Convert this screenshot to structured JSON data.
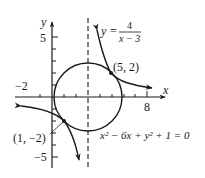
{
  "axes": {
    "x_label": "x",
    "y_label": "y",
    "x_tick_labels": {
      "neg": "−2",
      "pos": "8"
    },
    "y_tick_labels": {
      "pos": "5",
      "neg": "−5"
    }
  },
  "curves": {
    "hyperbola": {
      "eq_lhs": "y =",
      "num": "4",
      "den": "x − 3"
    },
    "circle": {
      "equation": "x² − 6x + y² + 1 = 0"
    },
    "asymptote": "x = 3"
  },
  "points": [
    {
      "label": "(5, 2)",
      "x": 5,
      "y": 2
    },
    {
      "label": "(1, −2)",
      "x": 1,
      "y": -2
    }
  ],
  "colors": {
    "ink": "#1a1a1a"
  }
}
